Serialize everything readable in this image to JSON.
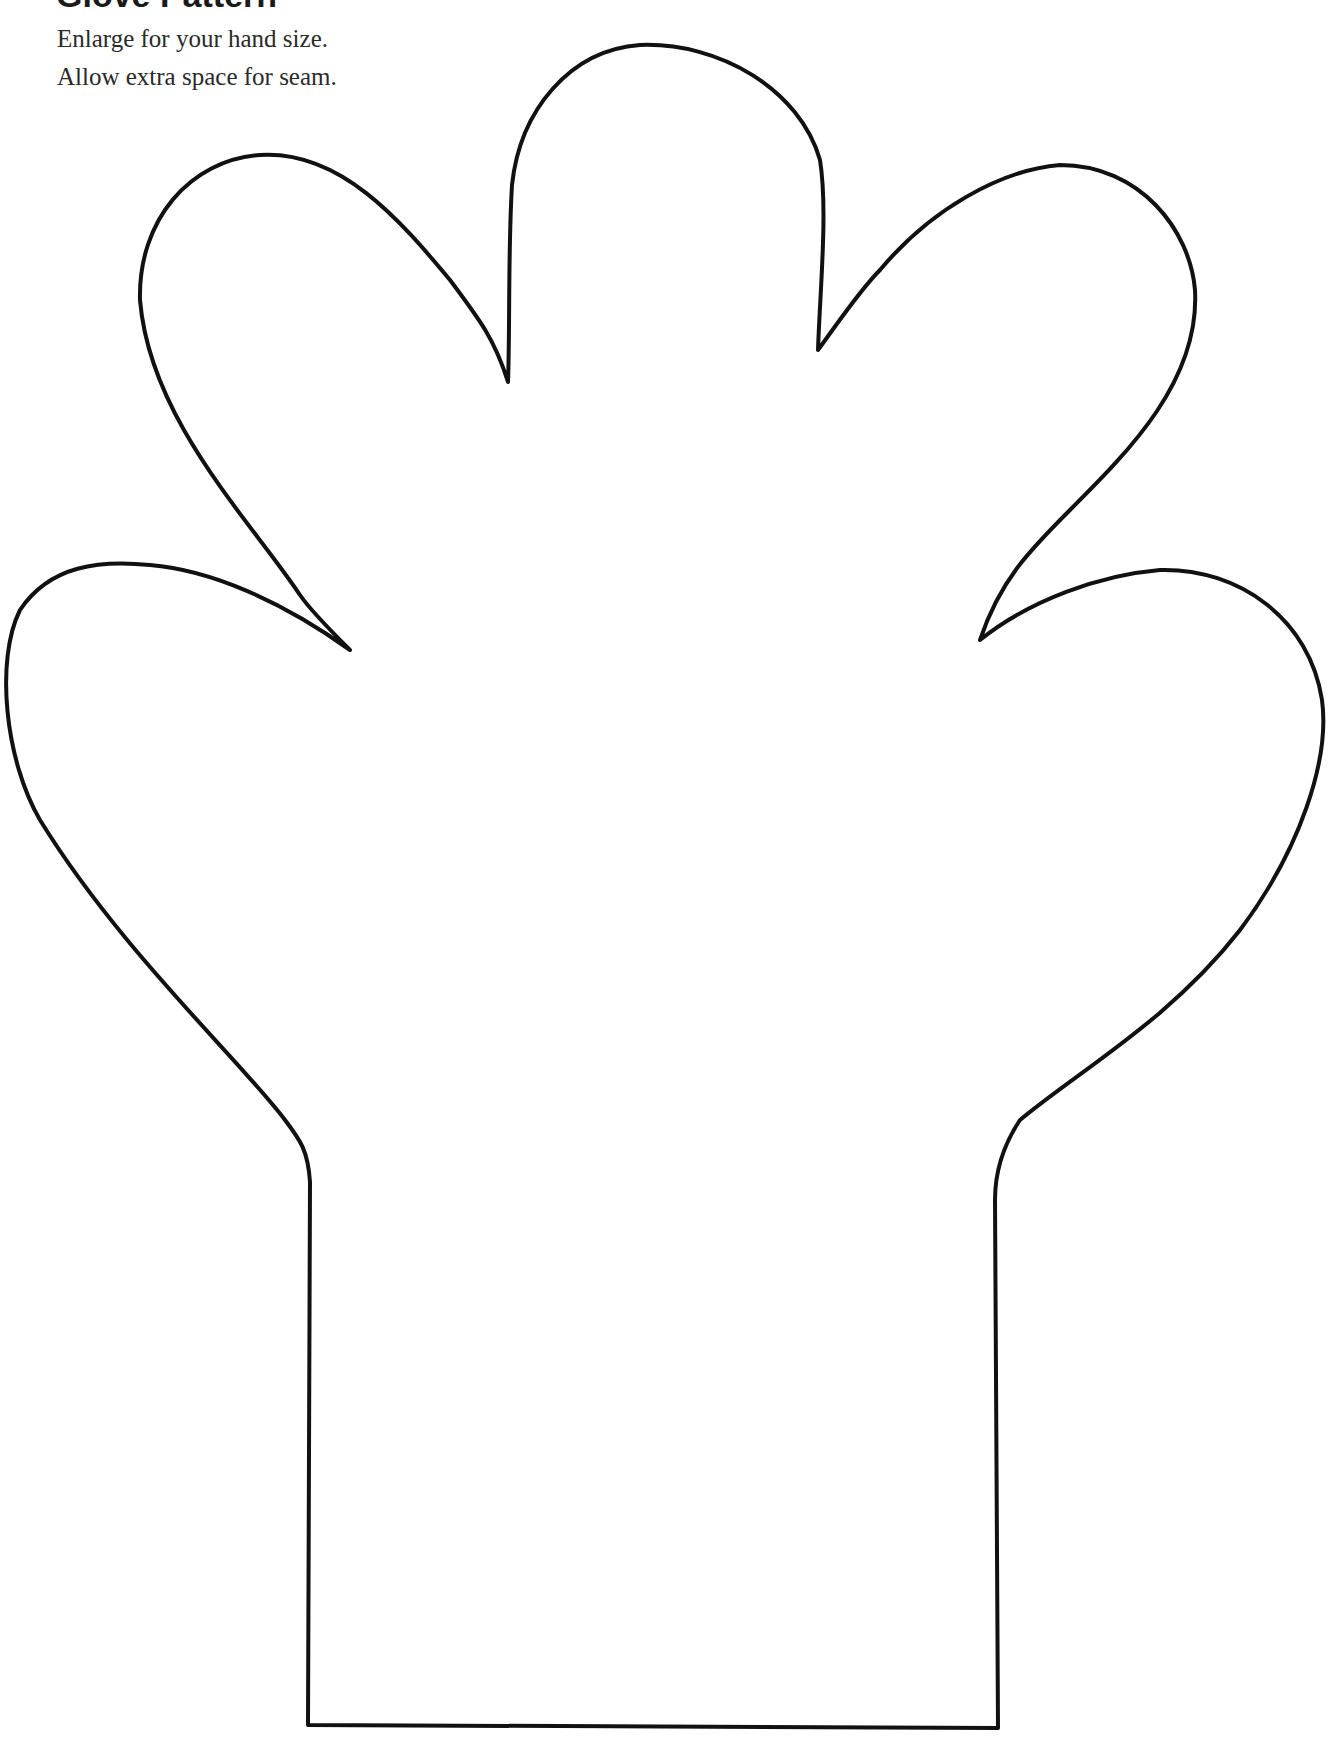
{
  "title": "Glove Pattern",
  "instructions": [
    "Enlarge for your hand size.",
    "Allow extra space for seam."
  ],
  "outline": {
    "stroke_color": "#111111",
    "fill_color": "#ffffff",
    "stroke_width": 4
  }
}
